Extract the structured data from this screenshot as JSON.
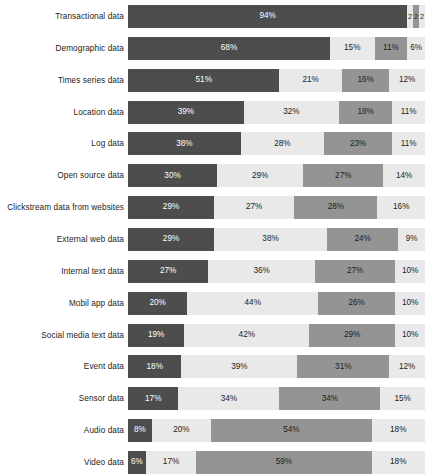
{
  "chart_data": {
    "type": "bar",
    "subtype": "stacked-horizontal-100pct",
    "title": "",
    "subtitle": "",
    "xlabel": "",
    "ylabel": "",
    "xlim": [
      0,
      100
    ],
    "grid": false,
    "legend": "none",
    "value_suffix": "%",
    "colors": {
      "series_1": "#4d4d4d",
      "series_2": "#e9e9e9",
      "series_3": "#949494",
      "series_4": "#e9e9e9",
      "label_dark": "#1c1c1c",
      "label_light": "#ffffff",
      "background": "#ffffff"
    },
    "series": [
      {
        "name": "series_1",
        "values": [
          94,
          68,
          51,
          39,
          38,
          30,
          29,
          29,
          27,
          20,
          19,
          18,
          17,
          8,
          6
        ]
      },
      {
        "name": "series_2",
        "values": [
          2,
          15,
          21,
          32,
          28,
          29,
          27,
          38,
          36,
          44,
          42,
          39,
          34,
          20,
          17
        ]
      },
      {
        "name": "series_3",
        "values": [
          2,
          11,
          16,
          18,
          23,
          27,
          28,
          24,
          27,
          26,
          29,
          31,
          34,
          54,
          59
        ]
      },
      {
        "name": "series_4",
        "values": [
          2,
          6,
          12,
          11,
          11,
          14,
          16,
          9,
          10,
          10,
          10,
          12,
          15,
          18,
          18
        ]
      }
    ],
    "categories": [
      "Transactional data",
      "Demographic data",
      "Times series data",
      "Location data",
      "Log data",
      "Open source data",
      "Clickstream data from websites",
      "External web data",
      "Internal text data",
      "Mobil app data",
      "Social media text data",
      "Event data",
      "Sensor data",
      "Audio data",
      "Video data"
    ],
    "rows": [
      {
        "label": "Transactional data",
        "segments": [
          {
            "value": 94,
            "text": "94%"
          },
          {
            "value": 2,
            "text": "2"
          },
          {
            "value": 2,
            "text": "2"
          },
          {
            "value": 2,
            "text": "2"
          }
        ]
      },
      {
        "label": "Demographic data",
        "segments": [
          {
            "value": 68,
            "text": "68%"
          },
          {
            "value": 15,
            "text": "15%"
          },
          {
            "value": 11,
            "text": "11%"
          },
          {
            "value": 6,
            "text": "6%"
          }
        ]
      },
      {
        "label": "Times series data",
        "segments": [
          {
            "value": 51,
            "text": "51%"
          },
          {
            "value": 21,
            "text": "21%"
          },
          {
            "value": 16,
            "text": "16%"
          },
          {
            "value": 12,
            "text": "12%"
          }
        ]
      },
      {
        "label": "Location data",
        "segments": [
          {
            "value": 39,
            "text": "39%"
          },
          {
            "value": 32,
            "text": "32%"
          },
          {
            "value": 18,
            "text": "18%"
          },
          {
            "value": 11,
            "text": "11%"
          }
        ]
      },
      {
        "label": "Log data",
        "segments": [
          {
            "value": 38,
            "text": "38%"
          },
          {
            "value": 28,
            "text": "28%"
          },
          {
            "value": 23,
            "text": "23%"
          },
          {
            "value": 11,
            "text": "11%"
          }
        ]
      },
      {
        "label": "Open source data",
        "segments": [
          {
            "value": 30,
            "text": "30%"
          },
          {
            "value": 29,
            "text": "29%"
          },
          {
            "value": 27,
            "text": "27%"
          },
          {
            "value": 14,
            "text": "14%"
          }
        ]
      },
      {
        "label": "Clickstream data from websites",
        "segments": [
          {
            "value": 29,
            "text": "29%"
          },
          {
            "value": 27,
            "text": "27%"
          },
          {
            "value": 28,
            "text": "28%"
          },
          {
            "value": 16,
            "text": "16%"
          }
        ]
      },
      {
        "label": "External web data",
        "segments": [
          {
            "value": 29,
            "text": "29%"
          },
          {
            "value": 38,
            "text": "38%"
          },
          {
            "value": 24,
            "text": "24%"
          },
          {
            "value": 9,
            "text": "9%"
          }
        ]
      },
      {
        "label": "Internal text data",
        "segments": [
          {
            "value": 27,
            "text": "27%"
          },
          {
            "value": 36,
            "text": "36%"
          },
          {
            "value": 27,
            "text": "27%"
          },
          {
            "value": 10,
            "text": "10%"
          }
        ]
      },
      {
        "label": "Mobil app data",
        "segments": [
          {
            "value": 20,
            "text": "20%"
          },
          {
            "value": 44,
            "text": "44%"
          },
          {
            "value": 26,
            "text": "26%"
          },
          {
            "value": 10,
            "text": "10%"
          }
        ]
      },
      {
        "label": "Social media text data",
        "segments": [
          {
            "value": 19,
            "text": "19%"
          },
          {
            "value": 42,
            "text": "42%"
          },
          {
            "value": 29,
            "text": "29%"
          },
          {
            "value": 10,
            "text": "10%"
          }
        ]
      },
      {
        "label": "Event data",
        "segments": [
          {
            "value": 18,
            "text": "18%"
          },
          {
            "value": 39,
            "text": "39%"
          },
          {
            "value": 31,
            "text": "31%"
          },
          {
            "value": 12,
            "text": "12%"
          }
        ]
      },
      {
        "label": "Sensor data",
        "segments": [
          {
            "value": 17,
            "text": "17%"
          },
          {
            "value": 34,
            "text": "34%"
          },
          {
            "value": 34,
            "text": "34%"
          },
          {
            "value": 15,
            "text": "15%"
          }
        ]
      },
      {
        "label": "Audio data",
        "segments": [
          {
            "value": 8,
            "text": "8%"
          },
          {
            "value": 20,
            "text": "20%"
          },
          {
            "value": 54,
            "text": "54%"
          },
          {
            "value": 18,
            "text": "18%"
          }
        ]
      },
      {
        "label": "Video data",
        "segments": [
          {
            "value": 6,
            "text": "6%"
          },
          {
            "value": 17,
            "text": "17%"
          },
          {
            "value": 59,
            "text": "59%"
          },
          {
            "value": 18,
            "text": "18%"
          }
        ]
      }
    ]
  }
}
